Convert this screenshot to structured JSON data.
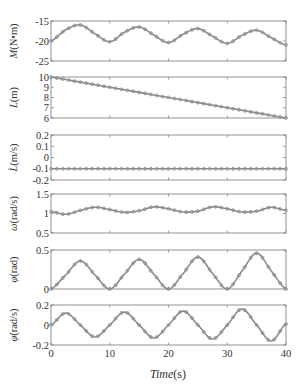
{
  "chart_data": {
    "type": "line",
    "layout": "6 vertically stacked subplots sharing x-axis",
    "xlabel": "Time(s)",
    "xlim": [
      0,
      40
    ],
    "xticks": [
      0,
      10,
      20,
      30,
      40
    ],
    "grid": false,
    "legend": null,
    "panels": [
      {
        "id": "M",
        "ylabel": "M (N•m)",
        "ylabel_symbol": "M",
        "ylabel_unit": "(N•m)",
        "ylim": [
          -25,
          -15
        ],
        "yticks": [
          -15,
          -20,
          -25
        ],
        "ytick_labels": [
          "-15",
          "-20",
          "-25"
        ],
        "x": [
          0,
          2.5,
          5,
          7.5,
          10,
          12.5,
          15,
          17.5,
          20,
          22.5,
          25,
          27.5,
          30,
          32.5,
          35,
          37.5,
          40
        ],
        "y": [
          -20.0,
          -17.2,
          -16.0,
          -18.2,
          -20.2,
          -17.8,
          -16.5,
          -18.5,
          -20.4,
          -18.3,
          -16.9,
          -18.8,
          -20.6,
          -18.6,
          -17.3,
          -19.2,
          -21.0
        ]
      },
      {
        "id": "L",
        "ylabel": "L (m)",
        "ylabel_symbol": "L",
        "ylabel_unit": "(m)",
        "ylim": [
          6,
          10
        ],
        "yticks": [
          10,
          9,
          8,
          7,
          6
        ],
        "ytick_labels": [
          "10",
          "9",
          "8",
          "7",
          "6"
        ],
        "x": [
          0,
          40
        ],
        "y": [
          10,
          6
        ]
      },
      {
        "id": "Ldot",
        "ylabel": "L̇ (m/s)",
        "ylabel_symbol": "L̇",
        "ylabel_unit": "(m/s)",
        "ylim": [
          -0.2,
          0.2
        ],
        "yticks": [
          0.2,
          0.1,
          0,
          -0.1,
          -0.2
        ],
        "ytick_labels": [
          "0.2",
          "0.1",
          "0",
          "-0.1",
          "-0.2"
        ],
        "x": [
          0,
          40
        ],
        "y": [
          -0.1,
          -0.1
        ]
      },
      {
        "id": "omega",
        "ylabel": "ω (rad/s)",
        "ylabel_symbol": "ω",
        "ylabel_unit": "(rad/s)",
        "ylim": [
          0.5,
          1.5
        ],
        "yticks": [
          1.5,
          1,
          0.5
        ],
        "ytick_labels": [
          "1.5",
          "1",
          "0.5"
        ],
        "x": [
          0,
          2.5,
          5,
          7.5,
          10,
          12.5,
          15,
          17.5,
          20,
          22.5,
          25,
          27.5,
          30,
          32.5,
          35,
          37.5,
          40
        ],
        "y": [
          1.05,
          0.98,
          1.08,
          1.16,
          1.1,
          1.03,
          1.07,
          1.17,
          1.12,
          1.04,
          1.06,
          1.17,
          1.12,
          1.04,
          1.06,
          1.16,
          1.08
        ]
      },
      {
        "id": "phi",
        "ylabel": "φ (rad)",
        "ylabel_symbol": "φ",
        "ylabel_unit": "(rad)",
        "ylim": [
          0,
          0.5
        ],
        "yticks": [
          0.5,
          0
        ],
        "ytick_labels": [
          "0.5",
          "0"
        ],
        "x": [
          0,
          2.5,
          5,
          7.5,
          10,
          12.5,
          15,
          17.5,
          20,
          22.5,
          25,
          27.5,
          30,
          32.5,
          35,
          37.5,
          40
        ],
        "y": [
          0.0,
          0.18,
          0.36,
          0.18,
          0.0,
          0.19,
          0.38,
          0.19,
          0.0,
          0.2,
          0.41,
          0.2,
          0.0,
          0.23,
          0.46,
          0.23,
          0.0
        ]
      },
      {
        "id": "phidot",
        "ylabel": "φ̇ (rad/s)",
        "ylabel_symbol": "φ̇",
        "ylabel_unit": "(rad/s)",
        "ylim": [
          -0.2,
          0.2
        ],
        "yticks": [
          0.2,
          0,
          -0.2
        ],
        "ytick_labels": [
          "0.2",
          "0",
          "-0.2"
        ],
        "x": [
          0,
          2.5,
          5,
          7.5,
          10,
          12.5,
          15,
          17.5,
          20,
          22.5,
          25,
          27.5,
          30,
          32.5,
          35,
          37.5,
          40
        ],
        "y": [
          0.0,
          0.12,
          0.0,
          -0.12,
          0.0,
          0.13,
          0.0,
          -0.13,
          0.0,
          0.14,
          0.0,
          -0.14,
          0.0,
          0.16,
          0.0,
          -0.16,
          0.01
        ]
      }
    ]
  },
  "style": {
    "line_color": "#8a8a8a",
    "frame_color": "#888888",
    "text_color": "#333333",
    "background": "#ffffff"
  }
}
